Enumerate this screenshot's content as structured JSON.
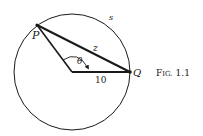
{
  "figure": {
    "caption": "Fig. 1.1",
    "caption_prefix": "F",
    "caption_smallcaps": "IG.",
    "caption_number": "1.1"
  },
  "labels": {
    "point_p": "P",
    "point_q": "Q",
    "arc": "s",
    "chord": "z",
    "angle": "θ",
    "radius": "10"
  },
  "colors": {
    "stroke": "#1a1a1a",
    "background": "#ffffff"
  }
}
